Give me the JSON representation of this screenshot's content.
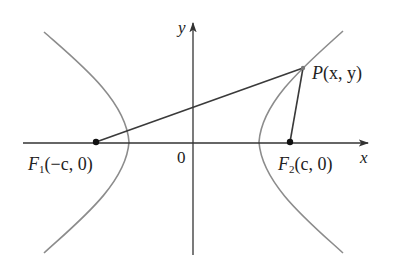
{
  "diagram": {
    "colors": {
      "background": "#ffffff",
      "axis": "#333333",
      "curve": "#8c8c8c",
      "segment": "#3a3a3a",
      "point": "#111111",
      "text": "#222222"
    },
    "axes": {
      "x_label": "x",
      "y_label": "y",
      "origin_label": "0"
    },
    "points": {
      "F1": {
        "name": "F",
        "subscript": "1",
        "coords": "(−c, 0)"
      },
      "F2": {
        "name": "F",
        "subscript": "2",
        "coords": "(c, 0)"
      },
      "P": {
        "name": "P",
        "coords": "(x, y)"
      }
    },
    "curve": {
      "type": "hyperbola",
      "branches": [
        "left",
        "right"
      ]
    },
    "segments": [
      "F1P",
      "F2P"
    ]
  }
}
